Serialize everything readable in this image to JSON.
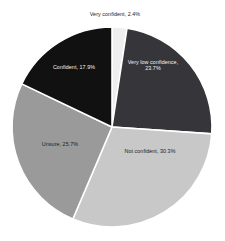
{
  "chart_data": {
    "type": "pie",
    "title": "",
    "subtitle": "",
    "xlabel": "",
    "ylabel": "",
    "grid": false,
    "legend": "none",
    "label_format": "{name}, {value}%",
    "start_angle_deg": -90,
    "direction": "clockwise",
    "center": {
      "x": 112,
      "y": 127
    },
    "radius": 100,
    "separator_color": "#ffffff",
    "background_color": "#ffffff",
    "categories": [
      "Very confident",
      "Very low confidence",
      "Not confident",
      "Unsure",
      "Confident"
    ],
    "values": [
      2.4,
      23.7,
      30.3,
      25.7,
      17.9
    ],
    "colors": [
      "#eeeeee",
      "#35353a",
      "#c8c8c8",
      "#9a9a9a",
      "#111111"
    ],
    "total": 100.0,
    "slices": [
      {
        "name": "Very confident",
        "value": 2.4,
        "color": "#eeeeee",
        "label": "Very confident, 2.4%",
        "label_placement": "outside-top",
        "label_color": "#1c1c1c"
      },
      {
        "name": "Very low confidence",
        "value": 23.7,
        "color": "#35353a",
        "label_line1": "Very low confidence,",
        "label_line2": "23.7%",
        "label": "Very low confidence, 23.7%",
        "label_placement": "inside",
        "label_color": "#f2f2f2"
      },
      {
        "name": "Not confident",
        "value": 30.3,
        "color": "#c8c8c8",
        "label": "Not confident, 30.3%",
        "label_placement": "inside",
        "label_color": "#1c1c1c"
      },
      {
        "name": "Unsure",
        "value": 25.7,
        "color": "#9a9a9a",
        "label": "Unsure, 25.7%",
        "label_placement": "inside",
        "label_color": "#1c1c1c"
      },
      {
        "name": "Confident",
        "value": 17.9,
        "color": "#111111",
        "label": "Confident, 17.9%",
        "label_placement": "inside",
        "label_color": "#f2f2f2"
      }
    ]
  }
}
